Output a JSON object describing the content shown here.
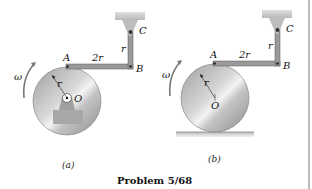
{
  "figure": {
    "title": "Problem 5/68",
    "panels": [
      {
        "caption": "(a)",
        "labels": {
          "omega": "ω",
          "A": "A",
          "B": "B",
          "C": "C",
          "O": "O",
          "r_disk": "r",
          "r_link": "r",
          "AB": "2r"
        },
        "support": "fixed pin bearing at O"
      },
      {
        "caption": "(b)",
        "labels": {
          "omega": "ω",
          "A": "A",
          "B": "B",
          "C": "C",
          "O": "O",
          "r_disk": "r",
          "r_link": "r",
          "AB": "2r"
        },
        "support": "disk rolling on horizontal ground"
      }
    ]
  },
  "colors": {
    "disk": "#b9b9b9",
    "link": "#9a9a9a",
    "bracket": "#c8c8c8",
    "ground": "#cfcfcf"
  }
}
